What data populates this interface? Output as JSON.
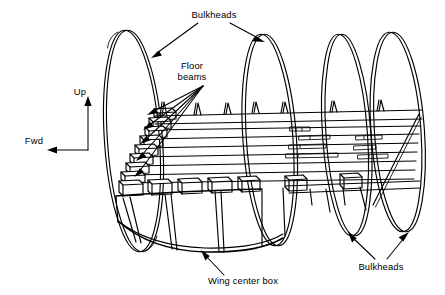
{
  "figure": {
    "background_color": "#ffffff",
    "ink_color": "#000000",
    "width": 445,
    "height": 295
  },
  "labels": {
    "bulkheads_top": "Bulkheads",
    "floor_beams_line1": "Floor",
    "floor_beams_line2": "beams",
    "wing_center_box": "Wing center box",
    "bulkheads_bottom": "Bulkheads"
  },
  "orientation": {
    "up_label": "Up",
    "fwd_label": "Fwd"
  },
  "structure": {
    "bulkhead_rings": [
      {
        "name": "bulkhead-ring-1",
        "cx": 132,
        "cy": 140,
        "rx": 27,
        "ry": 110,
        "tilt": -4
      },
      {
        "name": "bulkhead-ring-2",
        "cx": 270,
        "cy": 140,
        "rx": 25,
        "ry": 105,
        "tilt": -4
      },
      {
        "name": "bulkhead-ring-3",
        "cx": 347,
        "cy": 135,
        "rx": 23,
        "ry": 100,
        "tilt": -4
      },
      {
        "name": "bulkhead-ring-4",
        "cx": 398,
        "cy": 132,
        "rx": 26,
        "ry": 100,
        "tilt": -4
      }
    ],
    "floor_beam_count": 8,
    "longitudinal_beam_count": 5,
    "wing_box_rib_count": 6,
    "wing_box_panel_count": 4
  }
}
